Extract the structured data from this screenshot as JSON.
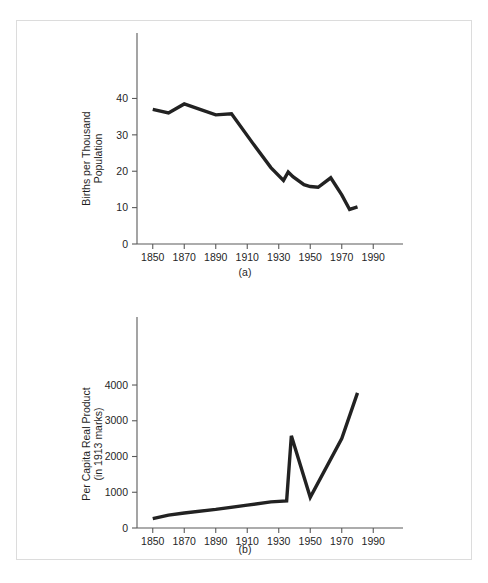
{
  "figure": {
    "background_color": "#ffffff",
    "frame_border_color": "#dcdcdc",
    "line_color": "#222222",
    "axis_color": "#5a5a5a"
  },
  "panels": [
    {
      "id": "a",
      "caption": "(a)",
      "y_axis_title_line1": "Births per Thousand",
      "y_axis_title_line2": "Population",
      "x_axis_title": ""
    },
    {
      "id": "b",
      "caption": "(b)",
      "y_axis_title_line1": "Per Capita Real Product",
      "y_axis_title_line2": "(in 1913 marks)",
      "x_axis_title": ""
    }
  ],
  "chart_data": [
    {
      "type": "line",
      "title": "",
      "panel_label": "(a)",
      "xlabel": "",
      "ylabel": "Births per Thousand Population",
      "xlim": [
        1840,
        2000
      ],
      "ylim": [
        0,
        47
      ],
      "xticks": [
        1850,
        1870,
        1890,
        1910,
        1930,
        1950,
        1970,
        1990
      ],
      "xticklabels": [
        "1850",
        "1870",
        "1890",
        "1910",
        "1930",
        "1950",
        "1970",
        "1990"
      ],
      "yticks": [
        0,
        10,
        20,
        30,
        40
      ],
      "yticklabels": [
        "0",
        "10",
        "20",
        "30",
        "40"
      ],
      "grid": false,
      "legend": false,
      "x": [
        1850,
        1860,
        1870,
        1880,
        1890,
        1900,
        1913,
        1925,
        1933,
        1936,
        1939,
        1946,
        1950,
        1955,
        1963,
        1970,
        1975,
        1980
      ],
      "values": [
        37.0,
        36.0,
        38.5,
        37.0,
        35.5,
        35.8,
        28.0,
        21.0,
        17.5,
        19.8,
        18.5,
        16.3,
        15.8,
        15.6,
        18.2,
        13.5,
        9.5,
        10.2
      ],
      "series": [
        {
          "name": "Births per thousand population",
          "values": [
            37.0,
            36.0,
            38.5,
            37.0,
            35.5,
            35.8,
            28.0,
            21.0,
            17.5,
            19.8,
            18.5,
            16.3,
            15.8,
            15.6,
            18.2,
            13.5,
            9.5,
            10.2
          ]
        }
      ]
    },
    {
      "type": "line",
      "title": "",
      "panel_label": "(b)",
      "xlabel": "",
      "ylabel": "Per Capita Real Product (in 1913 marks)",
      "xlim": [
        1840,
        2000
      ],
      "ylim": [
        0,
        4700
      ],
      "xticks": [
        1850,
        1870,
        1890,
        1910,
        1930,
        1950,
        1970,
        1990
      ],
      "xticklabels": [
        "1850",
        "1870",
        "1890",
        "1910",
        "1930",
        "1950",
        "1970",
        "1990"
      ],
      "yticks": [
        0,
        1000,
        2000,
        3000,
        4000
      ],
      "yticklabels": [
        "0",
        "1000",
        "2000",
        "3000",
        "4000"
      ],
      "grid": false,
      "legend": false,
      "x": [
        1850,
        1860,
        1870,
        1890,
        1910,
        1925,
        1935,
        1938,
        1950,
        1970,
        1980
      ],
      "values": [
        260,
        360,
        420,
        520,
        640,
        730,
        760,
        2580,
        860,
        2500,
        3780
      ],
      "series": [
        {
          "name": "Per capita real product (1913 marks)",
          "values": [
            260,
            360,
            420,
            520,
            640,
            730,
            760,
            2580,
            860,
            2500,
            3780
          ]
        }
      ]
    }
  ]
}
